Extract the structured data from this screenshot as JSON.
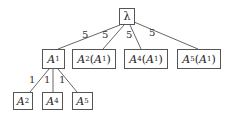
{
  "diagram": {
    "type": "tree",
    "root": {
      "id": "lambda",
      "label": "λ"
    },
    "level1": [
      {
        "id": "A1",
        "main": "A",
        "sub": "1",
        "suffix": "",
        "edge_label": "5"
      },
      {
        "id": "A2A1",
        "main": "A",
        "sub": "2",
        "suffix_main": "A",
        "suffix_sub": "1",
        "edge_label": "5"
      },
      {
        "id": "A4A1",
        "main": "A",
        "sub": "4",
        "suffix_main": "A",
        "suffix_sub": "1",
        "edge_label": "5"
      },
      {
        "id": "A5A1",
        "main": "A",
        "sub": "5",
        "suffix_main": "A",
        "suffix_sub": "1",
        "edge_label": "5"
      }
    ],
    "level2": [
      {
        "id": "A2",
        "main": "A",
        "sub": "2",
        "parent": "A1",
        "edge_label": "1"
      },
      {
        "id": "A4",
        "main": "A",
        "sub": "4",
        "parent": "A1",
        "edge_label": "1"
      },
      {
        "id": "A5",
        "main": "A",
        "sub": "5",
        "parent": "A1",
        "edge_label": "1"
      }
    ],
    "colors": {
      "line": "#555555",
      "text": "#222222",
      "background": "#ffffff"
    }
  }
}
